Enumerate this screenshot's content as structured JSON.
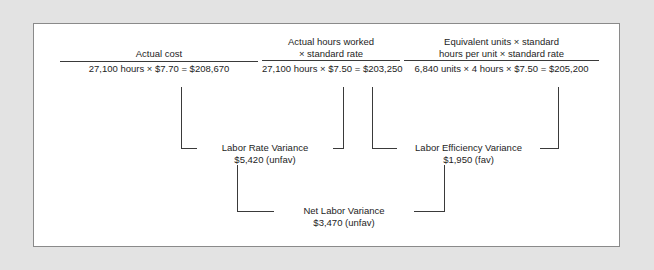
{
  "diagram": {
    "type": "labor-variance-flow",
    "columns": [
      {
        "id": "actual-cost",
        "heading_line1": "Actual cost",
        "heading_line2": "",
        "formula": "27,100 hours × $7.70 = $208,670",
        "amount": "$208,670"
      },
      {
        "id": "actual-hours-at-standard-rate",
        "heading_line1": "Actual hours worked",
        "heading_line2": "× standard rate",
        "formula": "27,100 hours × $7.50 = $203,250",
        "amount": "$203,250"
      },
      {
        "id": "standard-hours-at-standard-rate",
        "heading_line1": "Equivalent units × standard",
        "heading_line2": "hours per unit × standard rate",
        "formula": "6,840 units × 4 hours × $7.50 = $205,200",
        "amount": "$205,200"
      }
    ],
    "variances": [
      {
        "id": "labor-rate-variance",
        "label": "Labor Rate Variance",
        "amount": "$5,420 (unfav)"
      },
      {
        "id": "labor-efficiency-variance",
        "label": "Labor Efficiency Variance",
        "amount": "$1,950 (fav)"
      },
      {
        "id": "net-labor-variance",
        "label": "Net Labor Variance",
        "amount": "$3,470 (unfav)"
      }
    ],
    "colors": {
      "page_background": "#e3e3e3",
      "card_background": "#ffffff",
      "card_border": "#8a8a8a",
      "line": "#3a3a3a",
      "text": "#1d1d1d"
    }
  }
}
